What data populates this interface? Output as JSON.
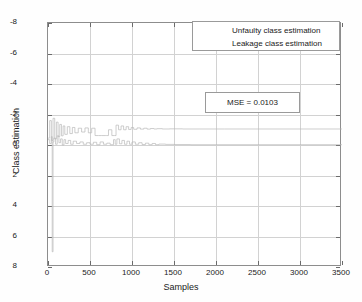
{
  "chart_data": {
    "type": "line",
    "title": "",
    "xlabel": "Samples",
    "ylabel": "Class estimation",
    "xlim": [
      0,
      3500
    ],
    "ylim": [
      -8,
      8
    ],
    "xticks": [
      0,
      500,
      1000,
      1500,
      2000,
      2500,
      3000,
      3500
    ],
    "yticks": [
      -8,
      -6,
      -4,
      -2,
      0,
      2,
      4,
      6,
      8
    ],
    "grid": true,
    "legend_position": "top-right",
    "annotations": [
      {
        "name": "mse-annotation",
        "text": "MSE = 0.0103",
        "x": 2000,
        "y": 2.6
      }
    ],
    "series": [
      {
        "name": "Unfaulty class estimation",
        "color": "#b9b9b9",
        "steady_value": 0.0,
        "x": [
          0,
          20,
          40,
          50,
          60,
          70,
          90,
          110,
          130,
          150,
          170,
          190,
          210,
          240,
          270,
          300,
          340,
          380,
          420,
          460,
          500,
          540,
          580,
          620,
          660,
          700,
          740,
          780,
          800,
          820,
          850,
          880,
          910,
          940,
          970,
          1000,
          1040,
          1080,
          1120,
          1160,
          1200,
          1240,
          1280,
          1320,
          1400,
          1500,
          1700,
          2000,
          2500,
          3000,
          3500
        ],
        "y": [
          0.35,
          0.1,
          0.55,
          -7.0,
          0.2,
          0.45,
          0.05,
          0.6,
          0.15,
          0.4,
          0.0,
          0.35,
          0.1,
          0.3,
          0.05,
          0.25,
          0.1,
          0.2,
          0.05,
          0.15,
          0.05,
          0.18,
          0.02,
          0.2,
          0.05,
          0.12,
          0.02,
          0.35,
          0.05,
          0.4,
          0.08,
          0.3,
          0.05,
          0.25,
          0.05,
          0.2,
          0.05,
          0.15,
          0.03,
          0.12,
          0.02,
          0.1,
          0.02,
          0.06,
          0.04,
          0.03,
          0.02,
          0.02,
          0.02,
          0.02,
          0.02
        ]
      },
      {
        "name": "Leakage class estimation",
        "color": "#b9b9b9",
        "steady_value": 1.05,
        "x": [
          0,
          20,
          40,
          60,
          80,
          100,
          120,
          140,
          160,
          180,
          200,
          230,
          260,
          290,
          320,
          360,
          400,
          440,
          480,
          520,
          560,
          600,
          640,
          680,
          700,
          720,
          760,
          790,
          810,
          840,
          870,
          900,
          930,
          960,
          990,
          1020,
          1060,
          1100,
          1140,
          1180,
          1220,
          1260,
          1300,
          1360,
          1450,
          1600,
          1800,
          2100,
          2500,
          3000,
          3500
        ],
        "y": [
          0.45,
          1.6,
          0.3,
          1.75,
          0.4,
          1.5,
          0.55,
          1.35,
          0.6,
          1.25,
          0.7,
          1.2,
          0.75,
          1.15,
          0.8,
          1.1,
          0.85,
          1.12,
          0.8,
          1.1,
          0.62,
          0.62,
          0.62,
          0.62,
          0.62,
          1.0,
          0.62,
          0.62,
          1.3,
          1.0,
          1.25,
          1.0,
          1.2,
          1.02,
          1.15,
          1.03,
          1.12,
          1.04,
          1.1,
          1.04,
          1.08,
          1.05,
          1.07,
          1.05,
          1.06,
          1.05,
          1.05,
          1.05,
          1.05,
          1.05,
          1.05
        ]
      }
    ]
  },
  "axes": {
    "x_title": "Samples",
    "y_title": "Class estimation",
    "x_tick_labels": [
      "0",
      "500",
      "1000",
      "1500",
      "2000",
      "2500",
      "3000",
      "3500"
    ],
    "y_tick_labels": [
      "8",
      "6",
      "4",
      "2",
      "0",
      "-2",
      "-4",
      "-6",
      "-8"
    ]
  },
  "legend": {
    "items": [
      {
        "label": "Unfaulty class estimation",
        "color": "#b9b9b9"
      },
      {
        "label": "Leakage class estimation",
        "color": "#b9b9b9"
      }
    ]
  },
  "annotation": {
    "mse_label": "MSE = 0.0103"
  },
  "colors": {
    "frame": "#8d8d8d",
    "grid": "#d2d2d2",
    "trace": "#b9b9b9",
    "text": "#1a1a1a",
    "background": "#ffffff"
  }
}
